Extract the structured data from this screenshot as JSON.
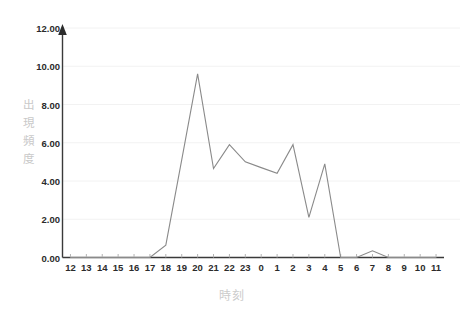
{
  "chart_data": {
    "type": "line",
    "title": "",
    "subtitle": "",
    "xlabel": "時刻",
    "ylabel": "出現頻度",
    "ylabel_chars": "出\n現\n頻\n度",
    "categories": [
      "12",
      "13",
      "14",
      "15",
      "16",
      "17",
      "18",
      "19",
      "20",
      "21",
      "22",
      "23",
      "0",
      "1",
      "2",
      "3",
      "4",
      "5",
      "6",
      "7",
      "8",
      "9",
      "10",
      "11"
    ],
    "values": [
      0,
      0,
      0,
      0,
      0,
      0,
      0.65,
      5.1,
      9.6,
      4.65,
      5.9,
      5.0,
      4.7,
      4.4,
      5.9,
      2.1,
      4.9,
      0,
      0,
      0.35,
      0,
      0,
      0,
      0
    ],
    "series": [
      {
        "name": "出現頻度",
        "values": [
          0,
          0,
          0,
          0,
          0,
          0,
          0.65,
          5.1,
          9.6,
          4.65,
          5.9,
          5.0,
          4.7,
          4.4,
          5.9,
          2.1,
          4.9,
          0,
          0,
          0.35,
          0,
          0,
          0,
          0
        ],
        "color": "#8a8a8a"
      }
    ],
    "ylim": [
      0,
      12
    ],
    "xlim": [
      "12",
      "11"
    ],
    "ytick_labels": [
      "0.00",
      "2.00",
      "4.00",
      "6.00",
      "8.00",
      "10.00",
      "12.00"
    ],
    "ytick_values": [
      0,
      2,
      4,
      6,
      8,
      10,
      12
    ],
    "ytick_step": 2,
    "grid": {
      "horizontal": true,
      "vertical": false,
      "color": "#f2f2f2"
    },
    "legend": {
      "visible": false,
      "position": "none",
      "entries": []
    },
    "markers": false,
    "axis_arrow_y": true,
    "annotations": []
  },
  "style": {
    "line_color": "#8a8a8a",
    "axis_color": "#3a3a3a",
    "grid_color": "#f2f2f2",
    "tick_label_color": "#2b2b2b",
    "axis_title_color": "#c9c9c9",
    "background": "#ffffff"
  }
}
